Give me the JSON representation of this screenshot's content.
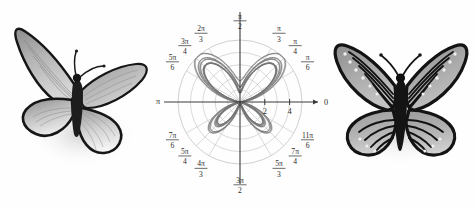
{
  "figure": {
    "background_color": "#ffffff",
    "width": 475,
    "height": 208
  },
  "left_image": {
    "name": "butterfly-photo-left",
    "alt": "Grayscale photograph of a pale butterfly with wings spread, angled to the left",
    "body_color": "#1e1e1e",
    "wing_fill_color": "#b9b9b9",
    "wing_outline_color": "#181818"
  },
  "right_image": {
    "name": "butterfly-photo-right",
    "alt": "Grayscale photograph of a monarch-style butterfly with dark veined wings, symmetric",
    "body_color": "#1a1a1a",
    "wing_fill_color": "#a8a8a8",
    "vein_color": "#111111",
    "spot_color": "#f2f2f2"
  },
  "chart_data": {
    "type": "line",
    "subtype": "polar",
    "title": "",
    "curve_name": "butterfly curve",
    "curve_color": "#6f6f6f",
    "grid": true,
    "grid_color": "#c9c9c9",
    "axis_color": "#3a3a3a",
    "rlim": [
      0,
      5
    ],
    "r_ticks": [
      2,
      4
    ],
    "r_tick_labels": [
      "2",
      "4"
    ],
    "theta_direction": "counterclockwise",
    "theta_zero_location": "E",
    "angle_ticks": [
      {
        "label_num": "",
        "label_den": "",
        "label_plain": "0",
        "deg": 0,
        "pos": "right"
      },
      {
        "label_num": "π",
        "label_den": "6",
        "label_plain": "π/6",
        "deg": 30
      },
      {
        "label_num": "π",
        "label_den": "4",
        "label_plain": "π/4",
        "deg": 45
      },
      {
        "label_num": "π",
        "label_den": "3",
        "label_plain": "π/3",
        "deg": 60
      },
      {
        "label_num": "π",
        "label_den": "2",
        "label_plain": "π/2",
        "deg": 90
      },
      {
        "label_num": "2π",
        "label_den": "3",
        "label_plain": "2π/3",
        "deg": 120
      },
      {
        "label_num": "3π",
        "label_den": "4",
        "label_plain": "3π/4",
        "deg": 135
      },
      {
        "label_num": "5π",
        "label_den": "6",
        "label_plain": "5π/6",
        "deg": 150
      },
      {
        "label_num": "",
        "label_den": "",
        "label_plain": "π",
        "deg": 180,
        "pos": "left"
      },
      {
        "label_num": "7π",
        "label_den": "6",
        "label_plain": "7π/6",
        "deg": 210
      },
      {
        "label_num": "5π",
        "label_den": "4",
        "label_plain": "5π/4",
        "deg": 225
      },
      {
        "label_num": "4π",
        "label_den": "3",
        "label_plain": "4π/3",
        "deg": 240
      },
      {
        "label_num": "3π",
        "label_den": "2",
        "label_plain": "3π/2",
        "deg": 270
      },
      {
        "label_num": "5π",
        "label_den": "3",
        "label_plain": "5π/3",
        "deg": 300
      },
      {
        "label_num": "7π",
        "label_den": "4",
        "label_plain": "7π/4",
        "deg": 315
      },
      {
        "label_num": "11π",
        "label_den": "6",
        "label_plain": "11π/6",
        "deg": 330
      }
    ],
    "equation": "r = e^{sin t} - 2 cos(4t) + sin^5((2t - pi)/24)",
    "xlabel": "",
    "ylabel": "",
    "legend": []
  }
}
